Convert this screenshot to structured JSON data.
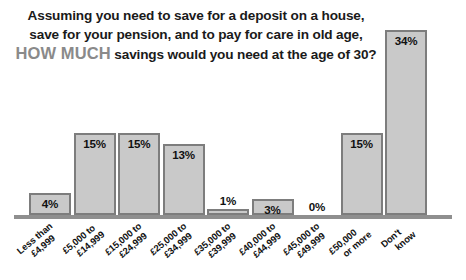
{
  "title": {
    "line1": "Assuming you need to save for a deposit on a house,",
    "line2": "save for your pension, and to pay for care in old age,",
    "line3_emphasis": "HOW MUCH",
    "line3_rest": " savings would you need at the age of 30?"
  },
  "colors": {
    "bar_fill": "#c9c9c9",
    "bar_border": "#7d7d7d",
    "axis": "#8f8f8f",
    "text": "#111111",
    "emphasis_text": "#8a8a8a",
    "background": "#ffffff"
  },
  "chart_data": {
    "type": "bar",
    "title": "Assuming you need to save for a deposit on a house, save for your pension, and to pay for care in old age, HOW MUCH savings would you need at the age of 30?",
    "xlabel": "",
    "ylabel": "",
    "ylim": [
      0,
      36
    ],
    "grid": false,
    "legend": false,
    "categories": [
      "Less than £4,999",
      "£5,000 to £14,999",
      "£15,000 to £24,999",
      "£25,000 to £34,999",
      "£35,000 to £39,999",
      "£40,000 to £44,999",
      "£45,000 to £49,999",
      "£50,000 or more",
      "Don't know"
    ],
    "values": [
      4,
      15,
      15,
      13,
      1,
      3,
      0,
      15,
      34
    ],
    "data_labels": [
      "4%",
      "15%",
      "15%",
      "13%",
      "1%",
      "3%",
      "0%",
      "15%",
      "34%"
    ],
    "bars": [
      {
        "category_line1": "Less than",
        "category_line2": "£4,999",
        "value": 4,
        "label": "4%",
        "label_position": "inside"
      },
      {
        "category_line1": "£5,000 to",
        "category_line2": "£14,999",
        "value": 15,
        "label": "15%",
        "label_position": "inside"
      },
      {
        "category_line1": "£15,000 to",
        "category_line2": "£24,999",
        "value": 15,
        "label": "15%",
        "label_position": "inside"
      },
      {
        "category_line1": "£25,000 to",
        "category_line2": "£34,999",
        "value": 13,
        "label": "13%",
        "label_position": "inside"
      },
      {
        "category_line1": "£35,000 to",
        "category_line2": "£39,999",
        "value": 1,
        "label": "1%",
        "label_position": "outside"
      },
      {
        "category_line1": "£40,000 to",
        "category_line2": "£44,999",
        "value": 3,
        "label": "3%",
        "label_position": "inside"
      },
      {
        "category_line1": "£45,000 to",
        "category_line2": "£49,999",
        "value": 0,
        "label": "0%",
        "label_position": "outside"
      },
      {
        "category_line1": "£50,000",
        "category_line2": "or more",
        "value": 15,
        "label": "15%",
        "label_position": "inside"
      },
      {
        "category_line1": "Don't",
        "category_line2": "know",
        "value": 34,
        "label": "34%",
        "label_position": "inside"
      }
    ]
  }
}
